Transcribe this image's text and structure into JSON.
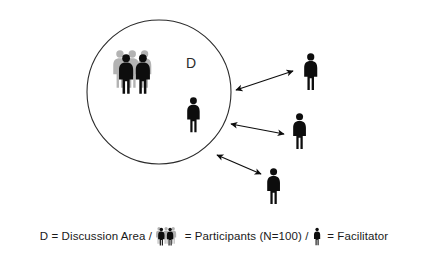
{
  "figure": {
    "background_color": "#ffffff",
    "width": 428,
    "height": 259
  },
  "diagram": {
    "discussion_area": {
      "label": "D",
      "shape": "circle",
      "stroke_color": "#2b2b2b",
      "center_x": 159,
      "center_y": 92,
      "radius": 72
    },
    "people_colors": {
      "foreground": "#0d0d0d",
      "background_crowd": "#b3b3b3"
    },
    "participant_group": {
      "name": "participants-cluster",
      "x": 112,
      "y": 50,
      "front_count": 2,
      "back_count": 3
    },
    "facilitators": [
      {
        "name": "facilitator-inside-circle",
        "x": 186,
        "y": 97,
        "inside_discussion_area": true
      },
      {
        "name": "facilitator-outer-top",
        "x": 303,
        "y": 53,
        "inside_discussion_area": false
      },
      {
        "name": "facilitator-outer-middle",
        "x": 292,
        "y": 113,
        "inside_discussion_area": false
      },
      {
        "name": "facilitator-outer-bottom",
        "x": 266,
        "y": 168,
        "inside_discussion_area": false
      }
    ],
    "arrows": [
      {
        "name": "arrow-top",
        "x1": 236,
        "y1": 90,
        "x2": 295,
        "y2": 72,
        "double_headed": true
      },
      {
        "name": "arrow-middle",
        "x1": 231,
        "y1": 124,
        "x2": 285,
        "y2": 134,
        "double_headed": true
      },
      {
        "name": "arrow-bottom",
        "x1": 217,
        "y1": 155,
        "x2": 262,
        "y2": 175,
        "double_headed": true
      }
    ]
  },
  "legend": {
    "part1": "D = Discussion Area / ",
    "icon_participants_name": "participants-icon",
    "part2": " = Participants (N=100) / ",
    "icon_facilitator_name": "facilitator-icon",
    "part3": " = Facilitator"
  }
}
